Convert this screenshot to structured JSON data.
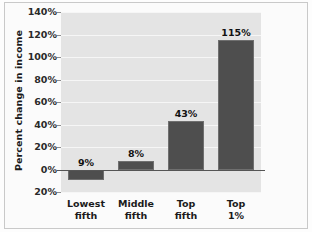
{
  "chart_data": {
    "type": "bar",
    "title": "",
    "xlabel": "",
    "ylabel": "Percent change in income",
    "categories": [
      "Lowest fifth",
      "Middle fifth",
      "Top fifth",
      "Top 1%"
    ],
    "category_lines": [
      [
        "Lowest",
        "fifth"
      ],
      [
        "Middle",
        "fifth"
      ],
      [
        "Top",
        "fifth"
      ],
      [
        "Top",
        "1%"
      ]
    ],
    "values": [
      -9,
      8,
      43,
      115
    ],
    "data_labels": [
      "9%",
      "8%",
      "43%",
      "115%"
    ],
    "ylim": [
      -20,
      140
    ],
    "yticks": [
      140,
      120,
      100,
      80,
      60,
      40,
      20,
      0,
      -20
    ],
    "ytick_labels": [
      "140%",
      "120%",
      "100%",
      "80%",
      "60%",
      "40%",
      "20%",
      "0%",
      "20%"
    ],
    "grid": true,
    "legend": null,
    "bar_color": "#4e4e4e",
    "plot_background": "#e4e4e4",
    "gridline_color": "#f6f6f6",
    "axis_color": "#555555"
  }
}
